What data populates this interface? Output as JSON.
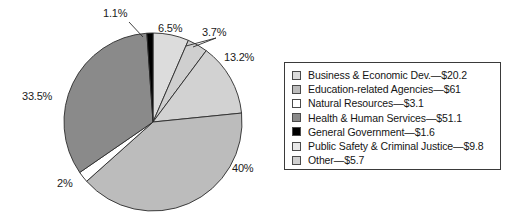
{
  "chart_data": {
    "type": "pie",
    "title": "",
    "xlabel": "",
    "ylabel": "",
    "legend_position": "right",
    "grid": false,
    "unit": "$ billions",
    "categories": [
      "Business & Economic Dev.",
      "Education-related Agencies",
      "Natural Resources",
      "Health & Human Services",
      "General Government",
      "Public Safety & Criminal Justice",
      "Other"
    ],
    "values": [
      20.2,
      61,
      3.1,
      51.1,
      1.6,
      9.8,
      5.7
    ],
    "percent_labels": [
      "6.5%",
      "40%",
      "2%",
      "33.5%",
      "1.1%",
      "13.2%",
      "3.7%"
    ],
    "colors": [
      "#d8d8d8",
      "#bfbfbf",
      "#ffffff",
      "#878787",
      "#000000",
      "#d0d0d0",
      "#c8c8c8"
    ],
    "slices": [
      {
        "label": "6.5%",
        "percent": 6.5,
        "color": "#dcdcdc",
        "category": "Business & Economic Dev."
      },
      {
        "label": "3.7%",
        "percent": 3.7,
        "color": "#cfcfcf",
        "category": "Other"
      },
      {
        "label": "13.2%",
        "percent": 13.2,
        "color": "#d2d2d2",
        "category": "Public Safety & Criminal Justice"
      },
      {
        "label": "40%",
        "percent": 40.0,
        "color": "#bcbcbc",
        "category": "Education-related Agencies"
      },
      {
        "label": "2%",
        "percent": 2.0,
        "color": "#ffffff",
        "category": "Natural Resources"
      },
      {
        "label": "33.5%",
        "percent": 33.5,
        "color": "#8a8a8a",
        "category": "Health & Human Services"
      },
      {
        "label": "1.1%",
        "percent": 1.1,
        "color": "#000000",
        "category": "General Government"
      }
    ]
  },
  "pie": {
    "labels": {
      "l_1_1": "1.1%",
      "l_6_5": "6.5%",
      "l_3_7": "3.7%",
      "l_13_2": "13.2%",
      "l_40": "40%",
      "l_2": "2%",
      "l_33_5": "33.5%"
    }
  },
  "legend": {
    "items": [
      {
        "label": "Business & Economic Dev.—$20.2",
        "color": "#dcdcdc"
      },
      {
        "label": "Education-related Agencies—$61",
        "color": "#bcbcbc"
      },
      {
        "label": "Natural Resources—$3.1",
        "color": "#ffffff"
      },
      {
        "label": "Health & Human Services—$51.1",
        "color": "#8a8a8a"
      },
      {
        "label": "General Government—$1.6",
        "color": "#000000"
      },
      {
        "label": "Public Safety & Criminal Justice—$9.8",
        "color": "#e8e8e8"
      },
      {
        "label": "Other—$5.7",
        "color": "#cfcfcf"
      }
    ]
  }
}
